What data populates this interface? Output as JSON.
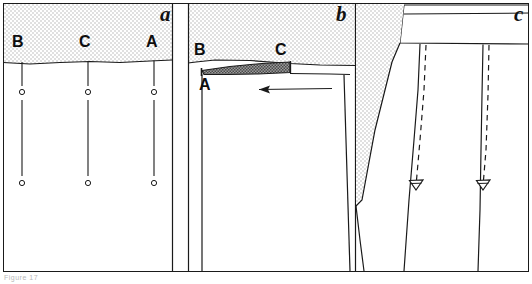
{
  "figure": {
    "caption_text": "Figure 17",
    "background_color": "#ffffff",
    "line_color": "#1a1a1a",
    "stipple_light_color": "#ededed",
    "stipple_dark_color": "#8c8c8c",
    "frame": {
      "x": 3,
      "y": 3,
      "width": 526,
      "height": 269
    }
  },
  "panels": [
    {
      "id": "a",
      "label": "a",
      "label_x": 160,
      "label_y": 6,
      "x_range": [
        3,
        172
      ],
      "description": "Undeformed state: three vertical marker lines labelled B, C and A descend from the stippled upper layer through the lower unit, each interrupted by small open circles.",
      "point_labels": [
        {
          "text": "B",
          "x": 12,
          "y": 36,
          "line_x": 22
        },
        {
          "text": "C",
          "x": 78,
          "y": 36,
          "line_x": 88
        },
        {
          "text": "A",
          "x": 145,
          "y": 36,
          "line_x": 154
        }
      ],
      "marker_geometry": {
        "stub_top_y": 62,
        "stub_bottom_y": 86,
        "upper_circle_y": 92,
        "long_line_top_y": 100,
        "long_line_bottom_y": 176,
        "lower_circle_y": 183,
        "circle_radius": 2.6
      }
    },
    {
      "id": "b",
      "label": "b",
      "label_x": 336,
      "label_y": 6,
      "x_range": [
        188,
        355
      ],
      "description": "Deformed state: the upper stippled layer is detached and overturned as a dark tapering flap between points B and C; point A marks the hinge at the left. A thin arrow indicates transport to the left.",
      "point_labels": [
        {
          "text": "B",
          "x": 195,
          "y": 44
        },
        {
          "text": "C",
          "x": 276,
          "y": 44
        },
        {
          "text": "A",
          "x": 200,
          "y": 78
        }
      ],
      "arrow": {
        "from_x": 332,
        "to_x": 258,
        "y": 89,
        "direction": "left"
      }
    },
    {
      "id": "c",
      "label": "c",
      "label_x": 515,
      "label_y": 6,
      "x_range": [
        355,
        529
      ],
      "description": "Final state: a stippled wedge tapers downward on the left; two solid shear surfaces are each paired with a dashed trace, terminating at hollow inverted-triangle markers that record displacement.",
      "markers": [
        {
          "type": "hollow-inverted-triangle",
          "x": 416,
          "y": 186
        },
        {
          "type": "hollow-inverted-triangle",
          "x": 481,
          "y": 186
        }
      ]
    }
  ]
}
